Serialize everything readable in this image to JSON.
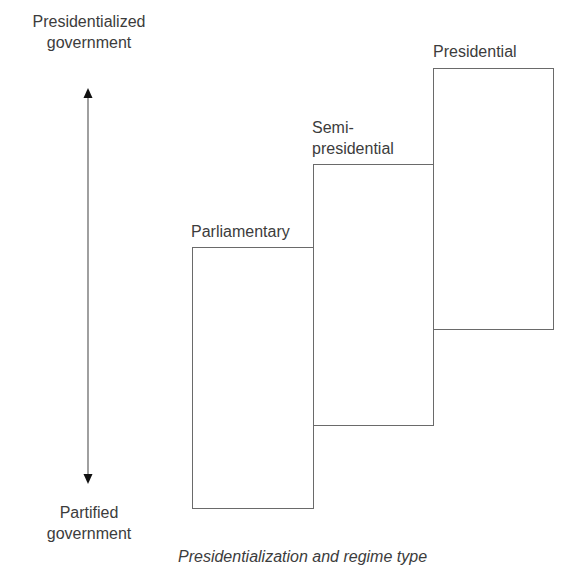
{
  "axis": {
    "top_label_line1": "Presidentialized",
    "top_label_line2": "government",
    "bottom_label_line1": "Partified",
    "bottom_label_line2": "government"
  },
  "boxes": [
    {
      "label": "Parliamentary"
    },
    {
      "label_line1": "Semi-",
      "label_line2": "presidential"
    },
    {
      "label": "Presidential"
    }
  ],
  "caption": "Presidentialization and regime type",
  "colors": {
    "line": "#6a6a6a",
    "text": "#3c3c3c",
    "arrow": "#111111"
  }
}
